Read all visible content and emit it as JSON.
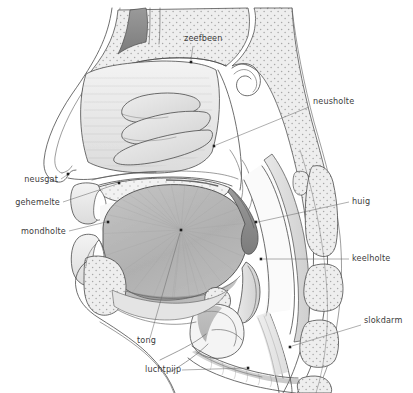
{
  "figure": {
    "language": "nl",
    "background_color": "#ffffff",
    "line_color": "#4a4a4a",
    "label_color": "#3b3b3b",
    "leader_color": "#6d6d6d",
    "dot_color": "#1d1d1d",
    "width": 413,
    "height": 393
  },
  "labels": [
    {
      "id": "zeefbeen",
      "text": "zeefbeen",
      "text_x": 184,
      "text_y": 41,
      "align": "start",
      "leader": "M 193 46 L 191 60",
      "dot_x": 191,
      "dot_y": 62
    },
    {
      "id": "neusholte",
      "text": "neusholte",
      "text_x": 313,
      "text_y": 104,
      "align": "start",
      "leader": "M 309 107 L 216 145",
      "dot_x": 214,
      "dot_y": 146
    },
    {
      "id": "huig",
      "text": "huig",
      "text_x": 352,
      "text_y": 204,
      "align": "start",
      "leader": "M 349 202 L 258 222",
      "dot_x": 256,
      "dot_y": 222
    },
    {
      "id": "keelholte",
      "text": "keelholte",
      "text_x": 352,
      "text_y": 261,
      "align": "start",
      "leader": "M 349 259 L 263 259",
      "dot_x": 261,
      "dot_y": 259
    },
    {
      "id": "slokdarm",
      "text": "slokdarm",
      "text_x": 364,
      "text_y": 323,
      "align": "start",
      "leader": "M 361 325 L 292 346",
      "dot_x": 290,
      "dot_y": 347
    },
    {
      "id": "neusgat",
      "text": "neusgat",
      "text_x": 58,
      "text_y": 182,
      "align": "end",
      "leader": "M 61 179 L 67 175",
      "dot_x": 68,
      "dot_y": 174
    },
    {
      "id": "gehemelte",
      "text": "gehemelte",
      "text_x": 60,
      "text_y": 205,
      "align": "end",
      "leader": "M 63 202 L 117 184",
      "dot_x": 119,
      "dot_y": 183
    },
    {
      "id": "mondholte",
      "text": "mondholte",
      "text_x": 66,
      "text_y": 234,
      "align": "end",
      "leader": "M 69 231 L 106 222",
      "dot_x": 108,
      "dot_y": 222
    },
    {
      "id": "tong",
      "text": "tong",
      "text_x": 137,
      "text_y": 343,
      "align": "start",
      "leader": "M 150 338 L 180 233",
      "dot_x": 181,
      "dot_y": 230
    },
    {
      "id": "luchtpijp",
      "text": "luchtpijp",
      "text_x": 145,
      "text_y": 372,
      "align": "start",
      "leader": "M 182 370 L 246 368",
      "dot_x": 248,
      "dot_y": 368
    }
  ],
  "structures": [
    {
      "id": "head-outline",
      "name": "head-profile-outline"
    },
    {
      "id": "nasal-cavity",
      "name": "nasal-cavity"
    },
    {
      "id": "turbinates",
      "name": "nasal-turbinates"
    },
    {
      "id": "ethmoid-bone",
      "name": "ethmoid-bone"
    },
    {
      "id": "sphenoid-sinus",
      "name": "sphenoid-sinus"
    },
    {
      "id": "hard-palate",
      "name": "hard-palate"
    },
    {
      "id": "soft-palate-uvula",
      "name": "soft-palate-uvula"
    },
    {
      "id": "tongue",
      "name": "tongue"
    },
    {
      "id": "oral-cavity",
      "name": "oral-cavity"
    },
    {
      "id": "upper-lip",
      "name": "upper-lip"
    },
    {
      "id": "lower-lip",
      "name": "lower-lip"
    },
    {
      "id": "mandible",
      "name": "mandible"
    },
    {
      "id": "pharynx",
      "name": "pharynx"
    },
    {
      "id": "epiglottis",
      "name": "epiglottis"
    },
    {
      "id": "larynx",
      "name": "larynx"
    },
    {
      "id": "trachea",
      "name": "trachea"
    },
    {
      "id": "esophagus",
      "name": "esophagus"
    },
    {
      "id": "vertebrae",
      "name": "cervical-vertebrae"
    },
    {
      "id": "hyoid-bone",
      "name": "hyoid-bone"
    },
    {
      "id": "spinal-cord",
      "name": "spinal-cord"
    }
  ]
}
